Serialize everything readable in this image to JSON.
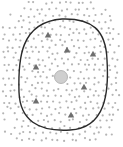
{
  "diagram": {
    "width": 123,
    "height": 147,
    "background": "#ffffff",
    "boundary": {
      "shape": "rounded-closed-curve",
      "color": "#2a2a2a",
      "path": "M 62 19 C 92 18, 106 30, 107 60 C 109 92, 106 128, 70 130 C 38 132, 20 120, 19 92 C 18 60, 20 22, 62 19 Z"
    },
    "center_circle": {
      "cx": 61,
      "cy": 77,
      "r": 6.5,
      "color": "#cfcfcf"
    },
    "triangles": [
      {
        "x": 48,
        "y": 35
      },
      {
        "x": 67,
        "y": 50
      },
      {
        "x": 93,
        "y": 54
      },
      {
        "x": 36,
        "y": 67
      },
      {
        "x": 84,
        "y": 87
      },
      {
        "x": 36,
        "y": 101
      },
      {
        "x": 71,
        "y": 115
      }
    ],
    "triangle_color": "#6e6e6e",
    "dot_color": "#b4b4b4",
    "dot_radius": 1.1,
    "dot_grid": {
      "spacing": 6.2,
      "x_min": 3,
      "x_max": 120,
      "y_min": 3,
      "y_max": 144,
      "jitter": 1.6,
      "falloff_radius_x": 62,
      "falloff_radius_y": 72
    }
  }
}
